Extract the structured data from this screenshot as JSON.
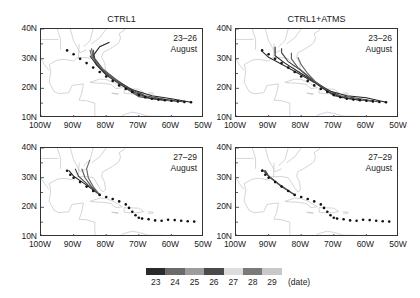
{
  "chart_data": [
    {
      "type": "map-track",
      "title": "CTRL1",
      "annotation": [
        "23–26",
        "August"
      ],
      "xlim": [
        -100,
        -50
      ],
      "ylim": [
        10,
        40
      ],
      "xticks": [
        "100W",
        "90W",
        "80W",
        "70W",
        "60W",
        "50W"
      ],
      "yticks": [
        "10N",
        "20N",
        "30N",
        "40N"
      ],
      "observed_track": [
        [
          -54,
          15.3
        ],
        [
          -56,
          15.4
        ],
        [
          -58,
          15.6
        ],
        [
          -60,
          15.8
        ],
        [
          -62,
          16
        ],
        [
          -64,
          16.2
        ],
        [
          -66,
          16.5
        ],
        [
          -68,
          17
        ],
        [
          -70,
          17.8
        ],
        [
          -72,
          18.8
        ],
        [
          -74,
          19.8
        ],
        [
          -76,
          21
        ],
        [
          -78,
          22.5
        ],
        [
          -80,
          24
        ],
        [
          -82,
          25.5
        ],
        [
          -84,
          27
        ],
        [
          -86,
          28.5
        ],
        [
          -88,
          30
        ],
        [
          -90,
          31.5
        ],
        [
          -92,
          32.8
        ]
      ],
      "forecast_tracks": [
        [
          [
            -54,
            15.3
          ],
          [
            -60,
            16.5
          ],
          [
            -66,
            17.5
          ],
          [
            -72,
            19.5
          ],
          [
            -76,
            22
          ],
          [
            -80,
            25
          ],
          [
            -83,
            28
          ],
          [
            -84,
            31
          ],
          [
            -82,
            34
          ],
          [
            -79,
            35.5
          ]
        ],
        [
          [
            -56,
            15.4
          ],
          [
            -62,
            16.3
          ],
          [
            -68,
            17.5
          ],
          [
            -73,
            20
          ],
          [
            -77,
            23
          ],
          [
            -81,
            26.5
          ],
          [
            -83.5,
            30
          ],
          [
            -84,
            33
          ]
        ],
        [
          [
            -58,
            15.6
          ],
          [
            -64,
            16.2
          ],
          [
            -70,
            17.2
          ],
          [
            -74,
            20
          ],
          [
            -78,
            23.5
          ],
          [
            -82,
            27
          ],
          [
            -84,
            30.5
          ],
          [
            -84.5,
            33.5
          ]
        ],
        [
          [
            -60,
            15.8
          ],
          [
            -66,
            16.5
          ],
          [
            -71,
            18
          ],
          [
            -75,
            21
          ],
          [
            -79,
            24.5
          ],
          [
            -82.5,
            28
          ],
          [
            -84.5,
            31
          ],
          [
            -85,
            33
          ]
        ],
        [
          [
            -62,
            16
          ],
          [
            -67,
            16.8
          ],
          [
            -71,
            18.5
          ],
          [
            -76,
            21.5
          ],
          [
            -80,
            24.5
          ],
          [
            -83,
            28
          ],
          [
            -85,
            31
          ]
        ]
      ]
    },
    {
      "type": "map-track",
      "title": "CTRL1+ATMS",
      "annotation": [
        "23–26",
        "August"
      ],
      "xlim": [
        -100,
        -50
      ],
      "ylim": [
        10,
        40
      ],
      "xticks": [
        "100W",
        "90W",
        "80W",
        "70W",
        "60W",
        "50W"
      ],
      "yticks": [
        "10N",
        "20N",
        "30N",
        "40N"
      ],
      "observed_track": [
        [
          -54,
          15.3
        ],
        [
          -56,
          15.4
        ],
        [
          -58,
          15.6
        ],
        [
          -60,
          15.8
        ],
        [
          -62,
          16
        ],
        [
          -64,
          16.2
        ],
        [
          -66,
          16.5
        ],
        [
          -68,
          17
        ],
        [
          -70,
          17.8
        ],
        [
          -72,
          18.8
        ],
        [
          -74,
          19.8
        ],
        [
          -76,
          21
        ],
        [
          -78,
          22.5
        ],
        [
          -80,
          24
        ],
        [
          -82,
          25.5
        ],
        [
          -84,
          27
        ],
        [
          -86,
          28.5
        ],
        [
          -88,
          30
        ],
        [
          -90,
          31.5
        ],
        [
          -92,
          32.8
        ]
      ],
      "forecast_tracks": [
        [
          [
            -54,
            15.3
          ],
          [
            -60,
            16.8
          ],
          [
            -66,
            17.5
          ],
          [
            -71,
            19
          ],
          [
            -75,
            21.5
          ],
          [
            -80,
            25
          ],
          [
            -85,
            28.5
          ],
          [
            -88,
            31
          ],
          [
            -88,
            34
          ]
        ],
        [
          [
            -56,
            15.4
          ],
          [
            -62,
            16.5
          ],
          [
            -68,
            17.5
          ],
          [
            -72,
            19.5
          ],
          [
            -76,
            22.5
          ],
          [
            -80,
            26
          ],
          [
            -84,
            29
          ],
          [
            -86,
            32
          ],
          [
            -86,
            33.5
          ]
        ],
        [
          [
            -58,
            15.6
          ],
          [
            -64,
            16.3
          ],
          [
            -70,
            17.5
          ],
          [
            -74,
            20.5
          ],
          [
            -78,
            24
          ],
          [
            -81,
            27
          ],
          [
            -83,
            30
          ],
          [
            -83,
            32
          ]
        ],
        [
          [
            -60,
            15.8
          ],
          [
            -66,
            16.6
          ],
          [
            -71,
            18.5
          ],
          [
            -75,
            21.5
          ],
          [
            -78,
            25
          ],
          [
            -80,
            28
          ],
          [
            -81,
            30.5
          ]
        ],
        [
          [
            -62,
            16
          ],
          [
            -68,
            17
          ],
          [
            -72,
            19
          ],
          [
            -76,
            22
          ],
          [
            -80,
            24.5
          ],
          [
            -85,
            27.5
          ],
          [
            -90,
            30.5
          ],
          [
            -92,
            32.5
          ]
        ]
      ]
    },
    {
      "type": "map-track",
      "title": "",
      "annotation": [
        "27–29",
        "August"
      ],
      "xlim": [
        -100,
        -50
      ],
      "ylim": [
        10,
        40
      ],
      "xticks": [
        "100W",
        "90W",
        "80W",
        "70W",
        "60W",
        "50W"
      ],
      "yticks": [
        "10N",
        "20N",
        "30N",
        "40N"
      ],
      "observed_track": [
        [
          -53,
          15.2
        ],
        [
          -55,
          15.3
        ],
        [
          -57,
          15.5
        ],
        [
          -59,
          15.7
        ],
        [
          -61,
          15.8
        ],
        [
          -63,
          15.5
        ],
        [
          -65,
          15.6
        ],
        [
          -67,
          16
        ],
        [
          -69,
          16.2
        ],
        [
          -70,
          16.5
        ],
        [
          -71,
          17.3
        ],
        [
          -72,
          18.5
        ],
        [
          -73,
          19.8
        ],
        [
          -74,
          21
        ],
        [
          -76,
          22
        ],
        [
          -78,
          22.8
        ],
        [
          -80,
          23.5
        ],
        [
          -82,
          24.2
        ],
        [
          -84,
          25.5
        ],
        [
          -86,
          27
        ],
        [
          -88,
          28.5
        ],
        [
          -90,
          30
        ],
        [
          -91,
          31
        ],
        [
          -92,
          32.3
        ]
      ],
      "forecast_tracks": [
        [
          [
            -82,
            24.2
          ],
          [
            -86,
            27.5
          ],
          [
            -90,
            30.5
          ],
          [
            -91.5,
            32.5
          ]
        ],
        [
          [
            -82,
            24.2
          ],
          [
            -85.5,
            27.5
          ],
          [
            -88.5,
            30.5
          ],
          [
            -89.5,
            33
          ]
        ],
        [
          [
            -82,
            24.2
          ],
          [
            -84.5,
            27
          ],
          [
            -86.5,
            30
          ],
          [
            -87.5,
            33
          ]
        ],
        [
          [
            -82,
            24.2
          ],
          [
            -84,
            27
          ],
          [
            -85.5,
            30
          ],
          [
            -86,
            33
          ],
          [
            -85,
            36
          ]
        ]
      ]
    },
    {
      "type": "map-track",
      "title": "",
      "annotation": [
        "27–29",
        "August"
      ],
      "xlim": [
        -100,
        -50
      ],
      "ylim": [
        10,
        40
      ],
      "xticks": [
        "100W",
        "90W",
        "80W",
        "70W",
        "60W",
        "50W"
      ],
      "yticks": [
        "10N",
        "20N",
        "30N",
        "40N"
      ],
      "observed_track": [
        [
          -53,
          15.2
        ],
        [
          -55,
          15.3
        ],
        [
          -57,
          15.5
        ],
        [
          -59,
          15.7
        ],
        [
          -61,
          15.8
        ],
        [
          -63,
          15.5
        ],
        [
          -65,
          15.6
        ],
        [
          -67,
          16
        ],
        [
          -69,
          16.2
        ],
        [
          -70,
          16.5
        ],
        [
          -71,
          17.3
        ],
        [
          -72,
          18.5
        ],
        [
          -73,
          19.8
        ],
        [
          -74,
          21
        ],
        [
          -76,
          22
        ],
        [
          -78,
          22.8
        ],
        [
          -80,
          23.5
        ],
        [
          -82,
          24.2
        ],
        [
          -84,
          25.5
        ],
        [
          -86,
          27
        ],
        [
          -88,
          28.5
        ],
        [
          -90,
          30
        ],
        [
          -91,
          31
        ],
        [
          -92,
          32.3
        ]
      ],
      "forecast_tracks": [
        [
          [
            -82,
            24.2
          ],
          [
            -86,
            27
          ],
          [
            -89.5,
            30
          ],
          [
            -91.5,
            32.5
          ]
        ],
        [
          [
            -82,
            24.2
          ],
          [
            -86.5,
            27.5
          ],
          [
            -90,
            30.5
          ],
          [
            -91,
            32.5
          ]
        ],
        [
          [
            -82,
            24.2
          ],
          [
            -87,
            28
          ],
          [
            -90.5,
            31
          ],
          [
            -92,
            32.8
          ]
        ]
      ]
    }
  ],
  "panels": {
    "tl": {
      "title": "CTRL1",
      "annot1": "23–26",
      "annot2": "August"
    },
    "tr": {
      "title": "CTRL1+ATMS",
      "annot1": "23–26",
      "annot2": "August"
    },
    "bl": {
      "annot1": "27–29",
      "annot2": "August"
    },
    "br": {
      "annot1": "27–29",
      "annot2": "August"
    }
  },
  "axis": {
    "yticks": [
      "40N",
      "30N",
      "20N",
      "10N"
    ],
    "xticks": [
      "100W",
      "90W",
      "80W",
      "70W",
      "60W",
      "50W"
    ]
  },
  "colorbar": {
    "labels": [
      "23",
      "24",
      "25",
      "26",
      "27",
      "28",
      "29"
    ],
    "colors": [
      "#2a2a2a",
      "#6a6a6a",
      "#9c9c9c",
      "#4a4a4a",
      "#dcdcdc",
      "#7a7a7a",
      "#c8c8c8"
    ],
    "unit": "(date)"
  }
}
